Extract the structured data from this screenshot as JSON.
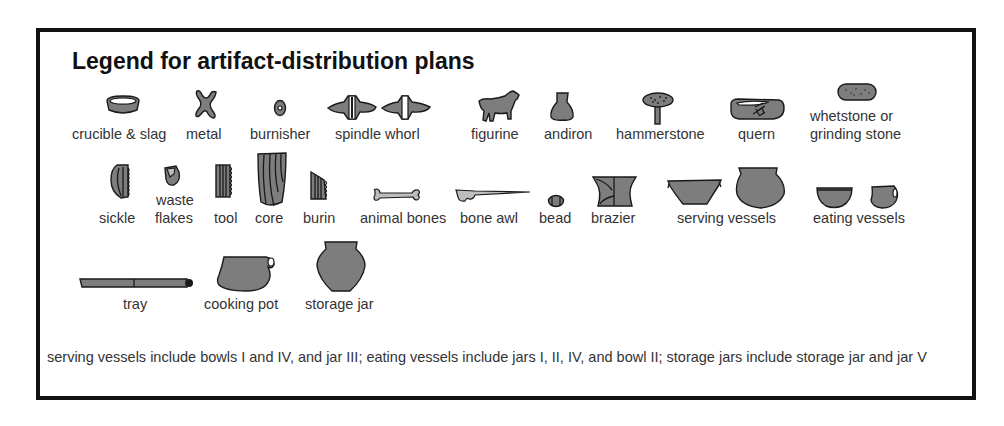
{
  "legend": {
    "title": "Legend for artifact-distribution plans",
    "fill_color": "#7d7d7d",
    "outline_color": "#1a1a1a",
    "border_color": "#111111",
    "rows": [
      {
        "items": [
          {
            "id": "crucible-slag",
            "label": "crucible & slag",
            "icon": "crucible-icon"
          },
          {
            "id": "metal",
            "label": "metal",
            "icon": "metal-icon"
          },
          {
            "id": "burnisher",
            "label": "burnisher",
            "icon": "burnisher-icon"
          },
          {
            "id": "spindle-whorl",
            "label": "spindle whorl",
            "icon": "spindle-whorl-icon"
          },
          {
            "id": "figurine",
            "label": "figurine",
            "icon": "figurine-icon"
          },
          {
            "id": "andiron",
            "label": "andiron",
            "icon": "andiron-icon"
          },
          {
            "id": "hammerstone",
            "label": "hammerstone",
            "icon": "hammerstone-icon"
          },
          {
            "id": "quern",
            "label": "quern",
            "icon": "quern-icon"
          },
          {
            "id": "whetstone",
            "label_line1": "whetstone or",
            "label_line2": "grinding stone",
            "icon": "whetstone-icon"
          }
        ]
      },
      {
        "items": [
          {
            "id": "sickle",
            "label": "sickle",
            "icon": "sickle-icon"
          },
          {
            "id": "waste-flakes",
            "label_line1": "waste",
            "label_line2": "flakes",
            "icon": "waste-flakes-icon"
          },
          {
            "id": "tool",
            "label": "tool",
            "icon": "tool-icon"
          },
          {
            "id": "core",
            "label": "core",
            "icon": "core-icon"
          },
          {
            "id": "burin",
            "label": "burin",
            "icon": "burin-icon"
          },
          {
            "id": "animal-bones",
            "label": "animal bones",
            "icon": "animal-bone-icon"
          },
          {
            "id": "bone-awl",
            "label": "bone awl",
            "icon": "bone-awl-icon"
          },
          {
            "id": "bead",
            "label": "bead",
            "icon": "bead-icon"
          },
          {
            "id": "brazier",
            "label": "brazier",
            "icon": "brazier-icon"
          },
          {
            "id": "serving-vessels",
            "label": "serving vessels",
            "icon": "serving-vessels-icon"
          },
          {
            "id": "eating-vessels",
            "label": "eating vessels",
            "icon": "eating-vessels-icon"
          }
        ]
      },
      {
        "items": [
          {
            "id": "tray",
            "label": "tray",
            "icon": "tray-icon"
          },
          {
            "id": "cooking-pot",
            "label": "cooking pot",
            "icon": "cooking-pot-icon"
          },
          {
            "id": "storage-jar",
            "label": "storage jar",
            "icon": "storage-jar-icon"
          }
        ]
      }
    ],
    "footnote": "serving vessels include bowls I and IV, and jar III; eating vessels include jars I, II, IV, and bowl II; storage jars include storage jar and jar V"
  }
}
